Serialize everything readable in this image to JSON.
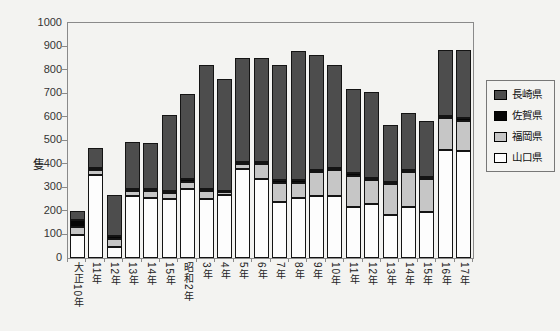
{
  "chart_data": {
    "type": "bar",
    "stacked": true,
    "title": "",
    "ylabel": "隻",
    "xlabel": "",
    "ylim": [
      0,
      1000
    ],
    "ytick_step": 100,
    "grid": false,
    "legend_position": "right",
    "categories": [
      "大正10年",
      "11年",
      "12年",
      "13年",
      "14年",
      "15年",
      "昭和2年",
      "3年",
      "4年",
      "5年",
      "6年",
      "7年",
      "8年",
      "9年",
      "10年",
      "11年",
      "12年",
      "13年",
      "14年",
      "15年",
      "16年",
      "17年"
    ],
    "series": [
      {
        "name": "山口県",
        "key": "yamaguchi",
        "color": "#fdfdfd",
        "values": [
          100,
          355,
          45,
          265,
          255,
          250,
          295,
          250,
          270,
          380,
          335,
          240,
          255,
          265,
          265,
          215,
          230,
          185,
          215,
          195,
          460,
          455
        ]
      },
      {
        "name": "福岡県",
        "key": "fukuoka",
        "color": "#c6c6c6",
        "values": [
          30,
          20,
          35,
          20,
          30,
          25,
          30,
          35,
          10,
          20,
          65,
          80,
          65,
          100,
          110,
          135,
          100,
          130,
          150,
          140,
          135,
          130
        ]
      },
      {
        "name": "佐賀県",
        "key": "saga",
        "color": "#050505",
        "values": [
          30,
          10,
          15,
          10,
          10,
          10,
          10,
          10,
          5,
          10,
          10,
          10,
          10,
          10,
          10,
          10,
          10,
          10,
          10,
          10,
          10,
          10
        ]
      },
      {
        "name": "長崎県",
        "key": "nagasaki",
        "color": "#4d4d4d",
        "values": [
          40,
          85,
          175,
          200,
          195,
          325,
          365,
          525,
          475,
          440,
          440,
          490,
          550,
          490,
          435,
          360,
          365,
          240,
          240,
          240,
          280,
          290
        ]
      }
    ],
    "totals": [
      200,
      470,
      270,
      495,
      490,
      610,
      700,
      820,
      760,
      850,
      850,
      820,
      880,
      865,
      820,
      720,
      705,
      565,
      615,
      585,
      885,
      885
    ],
    "legend_order": [
      "長崎県",
      "佐賀県",
      "福岡県",
      "山口県"
    ]
  }
}
